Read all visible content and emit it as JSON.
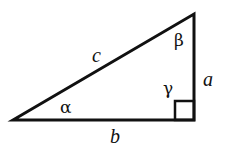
{
  "diagram": {
    "type": "right-triangle",
    "colors": {
      "stroke": "#111111",
      "background": "#ffffff"
    },
    "vertices": {
      "left": [
        13,
        120
      ],
      "top": [
        194,
        14
      ],
      "right_angle": [
        194,
        120
      ]
    },
    "sides": {
      "hypotenuse": "c",
      "vertical_leg": "a",
      "base": "b"
    },
    "angles": {
      "left_angle": "α",
      "top_angle": "β",
      "right_angle": "γ"
    }
  }
}
